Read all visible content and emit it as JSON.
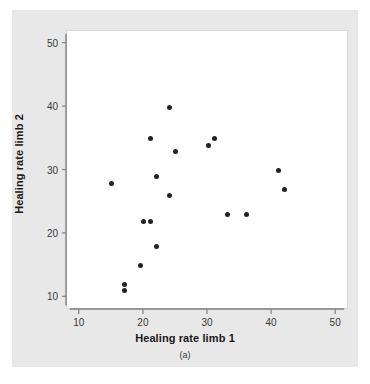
{
  "figure": {
    "caption": "(a)",
    "panel_color": "#e8e8e8",
    "plot_bg": "#ffffff",
    "marker_color": "#222222",
    "axis_color": "#808080"
  },
  "chart_data": {
    "type": "scatter",
    "title": "",
    "xlabel": "Healing rate limb 1",
    "ylabel": "Healing rate limb 2",
    "xlim": [
      8,
      52
    ],
    "ylim": [
      8,
      52
    ],
    "xticks": [
      10,
      20,
      30,
      40,
      50
    ],
    "yticks": [
      10,
      20,
      30,
      40,
      50
    ],
    "xtick_labels": [
      "10",
      "20",
      "30",
      "40",
      "50"
    ],
    "ytick_labels": [
      "10",
      "20",
      "30",
      "40",
      "50"
    ],
    "grid": false,
    "legend": null,
    "series": [
      {
        "name": "healing rates",
        "points": [
          {
            "x": 15,
            "y": 28
          },
          {
            "x": 17,
            "y": 12
          },
          {
            "x": 17,
            "y": 11
          },
          {
            "x": 19.5,
            "y": 15
          },
          {
            "x": 20,
            "y": 22
          },
          {
            "x": 21,
            "y": 22
          },
          {
            "x": 21,
            "y": 35
          },
          {
            "x": 22,
            "y": 18
          },
          {
            "x": 22,
            "y": 29
          },
          {
            "x": 24,
            "y": 26
          },
          {
            "x": 24,
            "y": 40
          },
          {
            "x": 25,
            "y": 33
          },
          {
            "x": 30,
            "y": 34
          },
          {
            "x": 31,
            "y": 35
          },
          {
            "x": 33,
            "y": 23
          },
          {
            "x": 36,
            "y": 23
          },
          {
            "x": 41,
            "y": 30
          },
          {
            "x": 42,
            "y": 27
          }
        ]
      }
    ]
  }
}
